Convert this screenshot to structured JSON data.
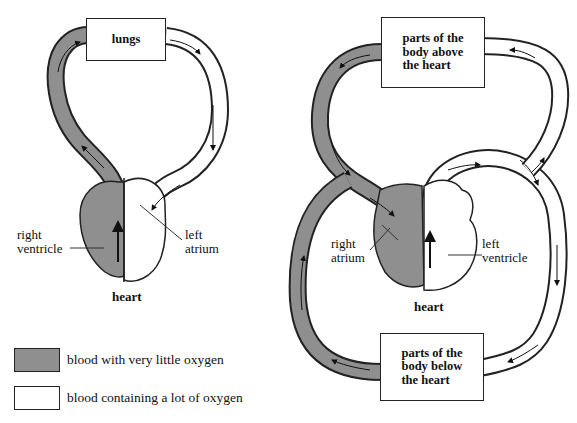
{
  "colors": {
    "deoxygenated": "#8f8f8f",
    "oxygenated": "#ffffff",
    "outline": "#222222"
  },
  "pulmonary": {
    "organ_box": "lungs",
    "heart_label": "heart",
    "label_left": [
      "right",
      "ventricle"
    ],
    "label_right": [
      "left",
      "atrium"
    ]
  },
  "systemic": {
    "top_box": [
      "parts of the",
      "body above",
      "the heart"
    ],
    "bottom_box": [
      "parts of the",
      "body below",
      "the heart"
    ],
    "heart_label": "heart",
    "label_left": [
      "right",
      "atrium"
    ],
    "label_right": [
      "left",
      "ventricle"
    ]
  },
  "legend": [
    {
      "swatch": "gray",
      "text": "blood with very little oxygen"
    },
    {
      "swatch": "white",
      "text": "blood containing a lot of oxygen"
    }
  ]
}
